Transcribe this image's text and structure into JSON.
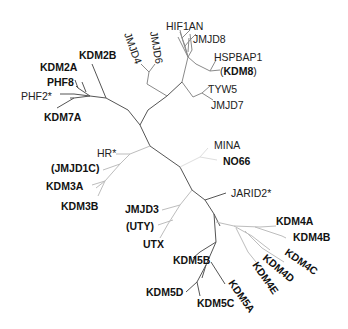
{
  "diagram": {
    "type": "unrooted-phylogenetic-tree",
    "colors": {
      "dark_branch": "#555555",
      "mid_branch": "#8a8a8a",
      "light_branch": "#bdbdbd",
      "faint_branch": "#dedede",
      "label": "#222222"
    },
    "leaves": [
      {
        "id": "hif1an",
        "label": "HIF1AN",
        "bold": false
      },
      {
        "id": "jmjd8",
        "label": "JMJD8",
        "bold": false
      },
      {
        "id": "jmjd4",
        "label": "JMJD4",
        "bold": false
      },
      {
        "id": "jmjd6",
        "label": "JMJD6",
        "bold": false
      },
      {
        "id": "hspbap1",
        "label": "HSPBAP1",
        "bold": false
      },
      {
        "id": "kdm8_paren_open",
        "label": "(",
        "bold": false
      },
      {
        "id": "kdm8",
        "label": "KDM8",
        "bold": true
      },
      {
        "id": "kdm8_paren_close",
        "label": ")",
        "bold": false
      },
      {
        "id": "tyw5",
        "label": "TYW5",
        "bold": false
      },
      {
        "id": "jmjd7",
        "label": "JMJD7",
        "bold": false
      },
      {
        "id": "kdm2b",
        "label": "KDM2B",
        "bold": true
      },
      {
        "id": "kdm2a",
        "label": "KDM2A",
        "bold": true
      },
      {
        "id": "phf8",
        "label": "PHF8",
        "bold": true
      },
      {
        "id": "phf2",
        "label": "PHF2*",
        "bold": false
      },
      {
        "id": "kdm7a",
        "label": "KDM7A",
        "bold": true
      },
      {
        "id": "hr",
        "label": "HR*",
        "bold": false
      },
      {
        "id": "jmjd1c",
        "label": "(JMJD1C)",
        "bold": true
      },
      {
        "id": "kdm3a",
        "label": "KDM3A",
        "bold": true
      },
      {
        "id": "kdm3b",
        "label": "KDM3B",
        "bold": true
      },
      {
        "id": "mina",
        "label": "MINA",
        "bold": false
      },
      {
        "id": "no66",
        "label": "NO66",
        "bold": true
      },
      {
        "id": "jarid2",
        "label": "JARID2*",
        "bold": false
      },
      {
        "id": "jmjd3",
        "label": "JMJD3",
        "bold": true
      },
      {
        "id": "uty",
        "label": "(UTY)",
        "bold": true
      },
      {
        "id": "utx",
        "label": "UTX",
        "bold": true
      },
      {
        "id": "kdm4a",
        "label": "KDM4A",
        "bold": true
      },
      {
        "id": "kdm4b",
        "label": "KDM4B",
        "bold": true
      },
      {
        "id": "kdm4c",
        "label": "KDM4C",
        "bold": true
      },
      {
        "id": "kdm4d",
        "label": "KDM4D",
        "bold": true
      },
      {
        "id": "kdm4e",
        "label": "KDM4E",
        "bold": true
      },
      {
        "id": "kdm5b",
        "label": "KDM5B",
        "bold": true
      },
      {
        "id": "kdm5a",
        "label": "KDM5A",
        "bold": true
      },
      {
        "id": "kdm5d",
        "label": "KDM5D",
        "bold": true
      },
      {
        "id": "kdm5c",
        "label": "KDM5C",
        "bold": true
      }
    ]
  }
}
